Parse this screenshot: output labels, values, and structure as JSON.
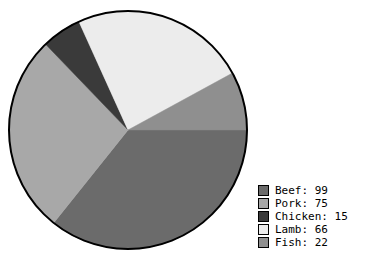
{
  "chart_data": {
    "type": "pie",
    "title": "",
    "categories": [
      "Beef",
      "Pork",
      "Chicken",
      "Lamb",
      "Fish"
    ],
    "values": [
      99,
      75,
      15,
      66,
      22
    ],
    "total": 277,
    "labels": [
      "Beef: 99",
      "Pork: 75",
      "Chicken: 15",
      "Lamb: 66",
      "Fish: 22"
    ],
    "colors": [
      "#6b6b6b",
      "#a8a8a8",
      "#3a3a3a",
      "#ececec",
      "#8f8f8f"
    ],
    "start_angle_deg": 0,
    "direction": "clockwise",
    "legend_position": "bottom-right",
    "grid": false,
    "outline_color": "#000000"
  },
  "legend": {
    "items": [
      {
        "name": "Beef",
        "value": 99,
        "text": "Beef: 99",
        "color": "#6b6b6b"
      },
      {
        "name": "Pork",
        "value": 75,
        "text": "Pork: 75",
        "color": "#a8a8a8"
      },
      {
        "name": "Chicken",
        "value": 15,
        "text": "Chicken: 15",
        "color": "#3a3a3a"
      },
      {
        "name": "Lamb",
        "value": 66,
        "text": "Lamb: 66",
        "color": "#ececec"
      },
      {
        "name": "Fish",
        "value": 22,
        "text": "Fish: 22",
        "color": "#8f8f8f"
      }
    ]
  },
  "geometry": {
    "center_x": 128,
    "center_y": 130,
    "radius": 119
  }
}
